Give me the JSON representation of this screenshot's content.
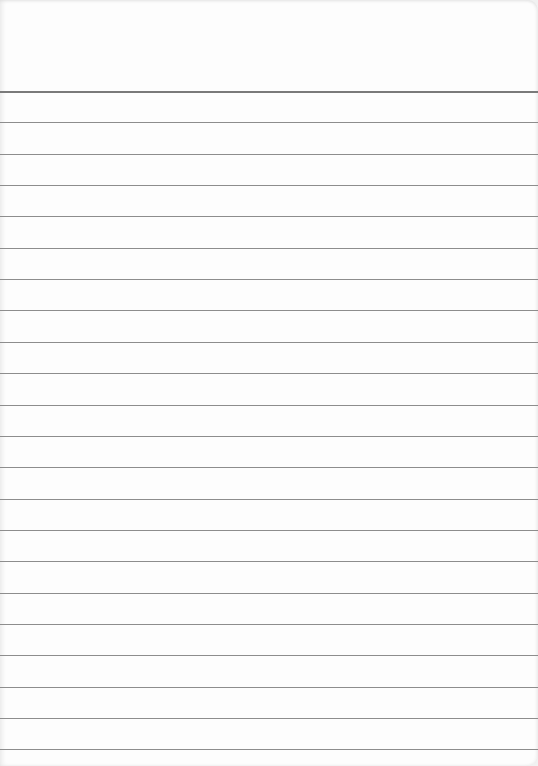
{
  "paper": {
    "type": "lined-paper",
    "background_color": "#fdfdfd",
    "line_color": "#8d8d8d",
    "first_line_y": 91,
    "line_spacing": 31.35,
    "line_count": 22
  }
}
